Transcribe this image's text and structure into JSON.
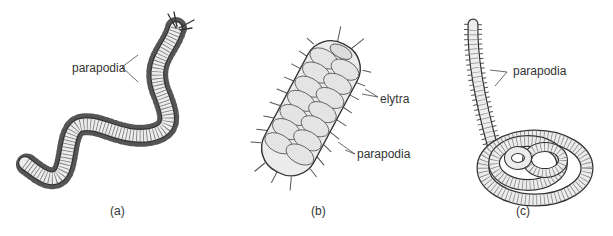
{
  "figure": {
    "panels": [
      {
        "id": "a",
        "caption": "(a)",
        "labels": [
          {
            "text": "parapodia"
          }
        ]
      },
      {
        "id": "b",
        "caption": "(b)",
        "labels": [
          {
            "text": "elytra"
          },
          {
            "text": "parapodia"
          }
        ]
      },
      {
        "id": "c",
        "caption": "(c)",
        "labels": [
          {
            "text": "parapodia"
          }
        ]
      }
    ],
    "colors": {
      "background": "#ffffff",
      "line": "#333333",
      "body_fill": "#ececec",
      "text": "#333333"
    }
  }
}
